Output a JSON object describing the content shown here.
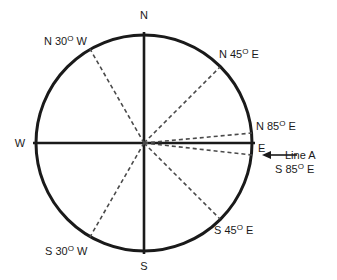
{
  "diagram": {
    "background_color": "#ffffff",
    "circle_color": "#1a1a1a",
    "axis_color": "#1a1a1a",
    "dashed_color": "#4a4a4a",
    "text_color": "#1a1a1a"
  },
  "cardinals": {
    "north": "N",
    "south": "S",
    "east": "E",
    "west": "W"
  },
  "bearings": [
    {
      "id": "n30w",
      "prefix": "N 30",
      "degree": "O",
      "suffix": " W",
      "full": "N 30O W",
      "angle_from_north_deg": 30,
      "quadrant": "NW"
    },
    {
      "id": "n45e",
      "prefix": "N 45",
      "degree": "O",
      "suffix": " E",
      "full": "N 45O E",
      "angle_from_north_deg": 45,
      "quadrant": "NE"
    },
    {
      "id": "n85e",
      "prefix": "N 85",
      "degree": "O",
      "suffix": " E",
      "full": "N 85O E",
      "angle_from_north_deg": 85,
      "quadrant": "NE"
    },
    {
      "id": "s85e",
      "prefix": "S 85",
      "degree": "O",
      "suffix": " E",
      "full": "S 85O E",
      "angle_from_south_deg": 85,
      "quadrant": "SE"
    },
    {
      "id": "s45e",
      "prefix": "S 45",
      "degree": "O",
      "suffix": " E",
      "full": "S 45O E",
      "angle_from_south_deg": 45,
      "quadrant": "SE"
    },
    {
      "id": "s30w",
      "prefix": "S 30",
      "degree": "O",
      "suffix": " W",
      "full": "S 30O W",
      "angle_from_south_deg": 30,
      "quadrant": "SW"
    }
  ],
  "annotation": {
    "line_label": "Line A",
    "bearing_prefix": "S 85",
    "bearing_degree": "O",
    "bearing_suffix": " E",
    "bearing_full": "S 85O E"
  }
}
